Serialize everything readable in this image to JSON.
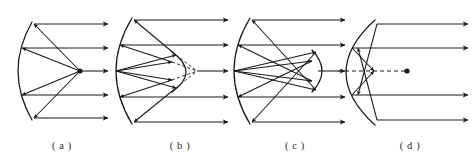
{
  "figure": {
    "background_color": "#ffffff",
    "stroke_color": "#1a1a1a",
    "width": 472,
    "height": 163
  },
  "panels": [
    {
      "id": "a",
      "caption": "( a )",
      "caption_x": 62,
      "caption_y": 140,
      "description": "Prime focus paraboloid: parallel rays reflect to a single on-axis focus",
      "axis_y": 71,
      "primary": {
        "type": "concave-parabolic-mirror",
        "vertex_x": 18,
        "top_x": 32,
        "top_y": 22,
        "bottom_x": 32,
        "bottom_y": 120,
        "bulge": "left"
      },
      "focus": {
        "x": 80,
        "y": 71,
        "marked": true
      },
      "incoming_rays": [
        {
          "y": 24,
          "x_start": 108,
          "x_end": 34
        },
        {
          "y": 48,
          "x_start": 108,
          "x_end": 22
        },
        {
          "y": 71,
          "x_start": 108,
          "x_end": 80
        },
        {
          "y": 95,
          "x_start": 108,
          "x_end": 22
        },
        {
          "y": 118,
          "x_start": 108,
          "x_end": 34
        }
      ],
      "reflected_rays": [
        {
          "from_x": 80,
          "from_y": 71,
          "to_x": 34,
          "to_y": 24
        },
        {
          "from_x": 80,
          "from_y": 71,
          "to_x": 22,
          "to_y": 48
        },
        {
          "from_x": 80,
          "from_y": 71,
          "to_x": 22,
          "to_y": 95
        },
        {
          "from_x": 80,
          "from_y": 71,
          "to_x": 34,
          "to_y": 118
        }
      ],
      "secondary": null,
      "dashed_rays": []
    },
    {
      "id": "b",
      "caption": "( b )",
      "caption_x": 180,
      "caption_y": 140,
      "description": "Cassegrain: convex secondary mirror, dashed virtual rays to focus behind it",
      "axis_y": 71,
      "primary": {
        "type": "concave-parabolic-mirror",
        "vertex_x": 116,
        "top_x": 132,
        "top_y": 18,
        "bottom_x": 132,
        "bottom_y": 124,
        "bulge": "left"
      },
      "focus": {
        "x": 197,
        "y": 71,
        "marked": false
      },
      "incoming_rays": [
        {
          "y": 20,
          "x_start": 228,
          "x_end": 134
        },
        {
          "y": 45,
          "x_start": 228,
          "x_end": 120
        },
        {
          "y": 71,
          "x_start": 228,
          "x_end": 197
        },
        {
          "y": 97,
          "x_start": 228,
          "x_end": 120
        },
        {
          "y": 122,
          "x_start": 228,
          "x_end": 134
        }
      ],
      "reflected_rays": [
        {
          "from_x": 116,
          "from_y": 71,
          "to_x": 176,
          "to_y": 55
        },
        {
          "from_x": 116,
          "from_y": 71,
          "to_x": 172,
          "to_y": 62
        },
        {
          "from_x": 116,
          "from_y": 71,
          "to_x": 172,
          "to_y": 80
        },
        {
          "from_x": 116,
          "from_y": 71,
          "to_x": 176,
          "to_y": 88
        },
        {
          "from_x": 176,
          "from_y": 55,
          "to_x": 134,
          "to_y": 20
        },
        {
          "from_x": 172,
          "from_y": 62,
          "to_x": 120,
          "to_y": 45
        },
        {
          "from_x": 172,
          "from_y": 80,
          "to_x": 120,
          "to_y": 97
        },
        {
          "from_x": 176,
          "from_y": 88,
          "to_x": 134,
          "to_y": 122
        }
      ],
      "secondary": {
        "type": "convex-mirror",
        "vertex_x": 186,
        "top_x": 172,
        "top_y": 52,
        "bottom_x": 172,
        "bottom_y": 92,
        "bulge": "right"
      },
      "dashed_rays": [
        {
          "from_x": 176,
          "from_y": 55,
          "to_x": 197,
          "to_y": 71
        },
        {
          "from_x": 172,
          "from_y": 62,
          "to_x": 197,
          "to_y": 71
        },
        {
          "from_x": 172,
          "from_y": 80,
          "to_x": 197,
          "to_y": 71
        },
        {
          "from_x": 176,
          "from_y": 88,
          "to_x": 197,
          "to_y": 71
        }
      ]
    },
    {
      "id": "c",
      "caption": "( c )",
      "caption_x": 295,
      "caption_y": 140,
      "description": "Gregorian: concave secondary mirror beyond the prime focus",
      "axis_y": 71,
      "primary": {
        "type": "concave-parabolic-mirror",
        "vertex_x": 234,
        "top_x": 250,
        "top_y": 18,
        "bottom_x": 250,
        "bottom_y": 124,
        "bulge": "left"
      },
      "focus": {
        "x": 302,
        "y": 71,
        "marked": false
      },
      "incoming_rays": [
        {
          "y": 20,
          "x_start": 345,
          "x_end": 252
        },
        {
          "y": 45,
          "x_start": 345,
          "x_end": 238
        },
        {
          "y": 71,
          "x_start": 345,
          "x_end": 318
        },
        {
          "y": 97,
          "x_start": 345,
          "x_end": 238
        },
        {
          "y": 122,
          "x_start": 345,
          "x_end": 252
        }
      ],
      "reflected_rays": [
        {
          "from_x": 234,
          "from_y": 71,
          "to_x": 316,
          "to_y": 52
        },
        {
          "from_x": 234,
          "from_y": 71,
          "to_x": 312,
          "to_y": 61
        },
        {
          "from_x": 234,
          "from_y": 71,
          "to_x": 312,
          "to_y": 81
        },
        {
          "from_x": 234,
          "from_y": 71,
          "to_x": 316,
          "to_y": 90
        },
        {
          "from_x": 316,
          "from_y": 52,
          "to_x": 252,
          "to_y": 122
        },
        {
          "from_x": 312,
          "from_y": 61,
          "to_x": 238,
          "to_y": 97
        },
        {
          "from_x": 312,
          "from_y": 81,
          "to_x": 238,
          "to_y": 45
        },
        {
          "from_x": 316,
          "from_y": 90,
          "to_x": 252,
          "to_y": 20
        }
      ],
      "secondary": {
        "type": "concave-mirror",
        "vertex_x": 322,
        "top_x": 312,
        "top_y": 50,
        "bottom_x": 312,
        "bottom_y": 92,
        "bulge": "right"
      },
      "dashed_rays": []
    },
    {
      "id": "d",
      "caption": "( d )",
      "caption_x": 410,
      "caption_y": 140,
      "description": "Deep spherical mirror showing spherical aberration; dashed optical axis to paraxial focus",
      "axis_y": 71,
      "primary": {
        "type": "concave-spherical-mirror",
        "vertex_x": 346,
        "top_x": 375,
        "top_y": 20,
        "bottom_x": 375,
        "bottom_y": 125,
        "bulge": "left"
      },
      "focus": {
        "x": 407,
        "y": 71,
        "marked": true
      },
      "incoming_rays": [
        {
          "y": 24,
          "x_start": 468,
          "x_end": 377
        },
        {
          "y": 48,
          "x_start": 468,
          "x_end": 352
        },
        {
          "y": 95,
          "x_start": 468,
          "x_end": 352
        },
        {
          "y": 120,
          "x_start": 468,
          "x_end": 377
        }
      ],
      "reflected_rays": [
        {
          "from_x": 377,
          "from_y": 24,
          "to_x": 358,
          "to_y": 95
        },
        {
          "from_x": 352,
          "from_y": 48,
          "to_x": 374,
          "to_y": 71
        },
        {
          "from_x": 352,
          "from_y": 95,
          "to_x": 374,
          "to_y": 71
        },
        {
          "from_x": 377,
          "from_y": 120,
          "to_x": 358,
          "to_y": 48
        }
      ],
      "secondary": null,
      "dashed_axis": {
        "x_start": 338,
        "x_end": 407,
        "y": 71
      },
      "dashed_rays": []
    }
  ]
}
